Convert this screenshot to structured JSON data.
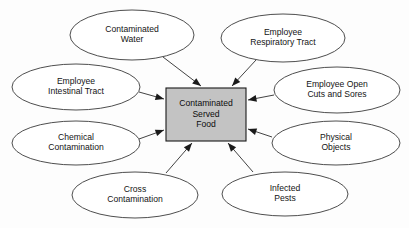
{
  "diagram": {
    "type": "hub-and-spoke-cause-diagram",
    "canvas": {
      "width": 409,
      "height": 228,
      "background": "#fdfdfd"
    },
    "center": {
      "name": "contaminated-served-food",
      "shape": "rectangle",
      "fill": "#c3c3c3",
      "stroke": "#1a1a1a",
      "x": 166,
      "y": 88,
      "width": 80,
      "height": 53,
      "lines": [
        "Contaminated",
        "Served",
        "Food"
      ]
    },
    "nodes": [
      {
        "id": "contaminated-water",
        "lines": [
          "Contaminated",
          "Water"
        ],
        "cx": 132,
        "cy": 35,
        "rx": 62,
        "ry": 25,
        "arrow_from": {
          "x": 163,
          "y": 57
        },
        "arrow_to": {
          "x": 201,
          "y": 86
        }
      },
      {
        "id": "employee-respiratory-tract",
        "lines": [
          "Employee",
          "Respiratory Tract"
        ],
        "cx": 283,
        "cy": 38,
        "rx": 62,
        "ry": 24,
        "arrow_from": {
          "x": 256,
          "y": 60
        },
        "arrow_to": {
          "x": 232,
          "y": 86
        }
      },
      {
        "id": "employee-intestinal-tract",
        "lines": [
          "Employee",
          "Intestinal Tract"
        ],
        "cx": 76,
        "cy": 87,
        "rx": 64,
        "ry": 23,
        "arrow_from": {
          "x": 139,
          "y": 92
        },
        "arrow_to": {
          "x": 164,
          "y": 99
        }
      },
      {
        "id": "employee-open-cuts-and-sores",
        "lines": [
          "Employee Open",
          "Cuts and Sores"
        ],
        "cx": 337,
        "cy": 90,
        "rx": 63,
        "ry": 23,
        "arrow_from": {
          "x": 274,
          "y": 95
        },
        "arrow_to": {
          "x": 248,
          "y": 100
        }
      },
      {
        "id": "chemical-contamination",
        "lines": [
          "Chemical",
          "Contamination"
        ],
        "cx": 76,
        "cy": 143,
        "rx": 64,
        "ry": 22,
        "arrow_from": {
          "x": 139,
          "y": 139
        },
        "arrow_to": {
          "x": 164,
          "y": 130
        }
      },
      {
        "id": "physical-objects",
        "lines": [
          "Physical",
          "Objects"
        ],
        "cx": 336,
        "cy": 143,
        "rx": 64,
        "ry": 22,
        "arrow_from": {
          "x": 272,
          "y": 137
        },
        "arrow_to": {
          "x": 248,
          "y": 129
        }
      },
      {
        "id": "cross-contamination",
        "lines": [
          "Cross",
          "Contamination"
        ],
        "cx": 135,
        "cy": 195,
        "rx": 63,
        "ry": 23,
        "arrow_from": {
          "x": 166,
          "y": 173
        },
        "arrow_to": {
          "x": 192,
          "y": 143
        }
      },
      {
        "id": "infected-pests",
        "lines": [
          "Infected",
          "Pests"
        ],
        "cx": 285,
        "cy": 194,
        "rx": 63,
        "ry": 22,
        "arrow_from": {
          "x": 253,
          "y": 172
        },
        "arrow_to": {
          "x": 228,
          "y": 143
        }
      }
    ]
  }
}
